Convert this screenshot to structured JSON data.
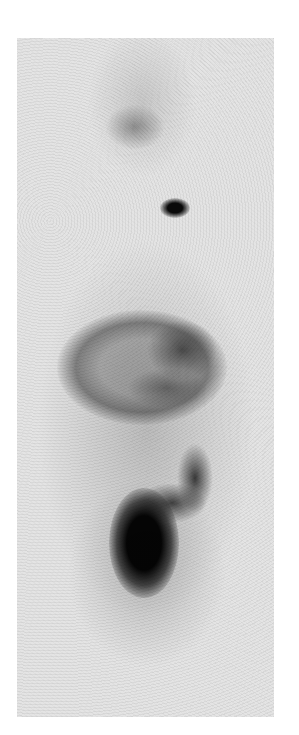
{
  "image": {
    "kind": "grayscale nuclear medicine scan (anterior whole-body/torso scintigraphy)",
    "background_color": "#ffffff",
    "field_color": "#e4e4e4",
    "regions": [
      {
        "name": "head-region",
        "description": "faint diffuse uptake"
      },
      {
        "name": "upper-focus",
        "description": "mild patchy uptake in head/neck"
      },
      {
        "name": "neck-hotspot",
        "description": "small intense focal uptake"
      },
      {
        "name": "abdominal-ring",
        "description": "ring-shaped moderate uptake"
      },
      {
        "name": "bowel-curve",
        "description": "curved band of uptake"
      },
      {
        "name": "pelvic-hotspot",
        "description": "large intense uptake (bladder region)"
      }
    ]
  }
}
